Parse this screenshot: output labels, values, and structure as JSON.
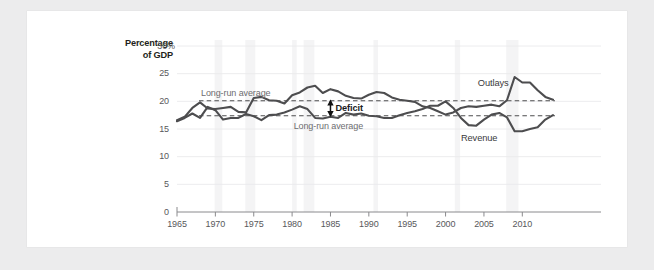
{
  "chart_data": {
    "type": "line",
    "title": "",
    "xlabel": "",
    "ylabel": "Percentage of GDP",
    "ylabel_line1": "Percentage",
    "ylabel_line2": "of GDP",
    "xlim": [
      1965,
      2014
    ],
    "ylim": [
      0,
      30
    ],
    "grid": true,
    "legend_position": "inline-annotations",
    "ytick_labels": [
      "30%",
      "25",
      "20",
      "15",
      "10",
      "5",
      "0"
    ],
    "ytick_values": [
      30,
      25,
      20,
      15,
      10,
      5,
      0
    ],
    "xtick_labels": [
      "1965",
      "1970",
      "1975",
      "1980",
      "1985",
      "1990",
      "1995",
      "2000",
      "2005",
      "2010"
    ],
    "xtick_values": [
      1965,
      1970,
      1975,
      1980,
      1985,
      1990,
      1995,
      2000,
      2005,
      2010
    ],
    "x": [
      1965,
      1966,
      1967,
      1968,
      1969,
      1970,
      1971,
      1972,
      1973,
      1974,
      1975,
      1976,
      1977,
      1978,
      1979,
      1980,
      1981,
      1982,
      1983,
      1984,
      1985,
      1986,
      1987,
      1988,
      1989,
      1990,
      1991,
      1992,
      1993,
      1994,
      1995,
      1996,
      1997,
      1998,
      1999,
      2000,
      2001,
      2002,
      2003,
      2004,
      2005,
      2006,
      2007,
      2008,
      2009,
      2010,
      2011,
      2012,
      2013,
      2014
    ],
    "series": [
      {
        "name": "Outlays",
        "color": "#4d4d4f",
        "values": [
          16.6,
          17.2,
          18.8,
          19.8,
          18.7,
          18.6,
          18.8,
          19.0,
          18.1,
          18.0,
          20.6,
          20.8,
          20.2,
          20.1,
          19.6,
          21.1,
          21.6,
          22.5,
          22.8,
          21.5,
          22.2,
          21.8,
          21.0,
          20.6,
          20.5,
          21.2,
          21.7,
          21.5,
          20.7,
          20.3,
          20.1,
          19.9,
          19.1,
          18.8,
          18.2,
          17.6,
          18.0,
          18.8,
          19.1,
          19.0,
          19.2,
          19.4,
          19.1,
          20.2,
          24.4,
          23.4,
          23.4,
          22.0,
          20.8,
          20.3
        ],
        "label_text": "Outlays",
        "long_run_average": 20.1,
        "avg_label": "Long-run average"
      },
      {
        "name": "Revenue",
        "color": "#4d4d4f",
        "values": [
          16.4,
          17.0,
          17.8,
          17.0,
          19.0,
          18.4,
          16.7,
          17.0,
          17.0,
          17.7,
          17.3,
          16.6,
          17.5,
          17.6,
          18.0,
          18.5,
          19.1,
          18.6,
          17.0,
          16.9,
          17.2,
          17.0,
          17.9,
          17.6,
          17.8,
          17.4,
          17.3,
          17.0,
          17.0,
          17.5,
          17.9,
          18.2,
          18.6,
          19.2,
          19.2,
          20.0,
          18.8,
          17.0,
          15.7,
          15.6,
          16.7,
          17.6,
          17.9,
          17.1,
          14.6,
          14.6,
          15.0,
          15.3,
          16.7,
          17.5
        ],
        "label_text": "Revenue",
        "long_run_average": 17.4,
        "avg_label": "Long-run average"
      }
    ],
    "annotations": [
      {
        "name": "deficit-arrow",
        "text": "Deficit",
        "x": 1985,
        "y_top": 20.1,
        "y_bottom": 17.4
      },
      {
        "name": "long-run-average-outlays",
        "text": "Long-run average"
      },
      {
        "name": "long-run-average-revenue",
        "text": "Long-run average"
      }
    ],
    "reference_lines": [
      {
        "name": "outlays-average",
        "value": 20.1,
        "style": "dashed",
        "color": "#4d4d4f"
      },
      {
        "name": "revenue-average",
        "value": 17.4,
        "style": "dashed",
        "color": "#4d4d4f"
      }
    ],
    "recession_bands": [
      [
        1969.9,
        1970.9
      ],
      [
        1973.9,
        1975.2
      ],
      [
        1980.0,
        1980.6
      ],
      [
        1981.5,
        1982.9
      ],
      [
        1990.6,
        1991.2
      ],
      [
        2001.2,
        2001.9
      ],
      [
        2007.9,
        2009.5
      ]
    ]
  },
  "colors": {
    "page_background": "#ececed",
    "card_background": "#ffffff",
    "line": "#4d4d4f",
    "grid": "#eaeaec",
    "axis": "#8a8a8d",
    "tick_text": "#58585b",
    "title_text": "#231f20",
    "band": "#f4f4f5"
  }
}
